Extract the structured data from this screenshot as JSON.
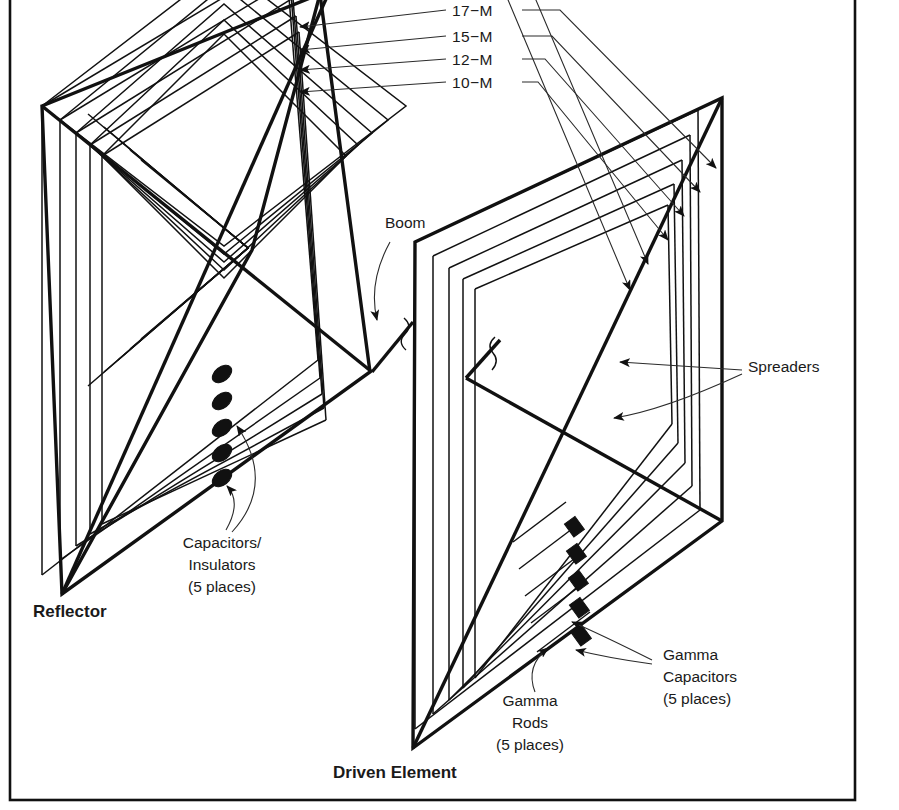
{
  "figure": {
    "kind": "line-drawing",
    "background_color": "#ffffff",
    "line_color": "#111111",
    "frame": {
      "visible": true,
      "x": 10,
      "y": 0,
      "width": 845,
      "height": 800
    }
  },
  "band_labels": [
    {
      "id": "band-20m",
      "text": "20−M",
      "visible_partially": true,
      "x": 452,
      "y": -6
    },
    {
      "id": "band-17m",
      "text": "17−M",
      "x": 452,
      "y": 14
    },
    {
      "id": "band-15m",
      "text": "15−M",
      "x": 452,
      "y": 41
    },
    {
      "id": "band-12m",
      "text": "12−M",
      "x": 452,
      "y": 64
    },
    {
      "id": "band-10m",
      "text": "10−M",
      "x": 452,
      "y": 87
    }
  ],
  "callouts": {
    "boom": {
      "label": "Boom",
      "x": 385,
      "y": 228
    },
    "spreaders": {
      "label": "Spreaders",
      "x": 748,
      "y": 372
    },
    "capacitors_insulators": {
      "line1": "Capacitors/",
      "line2": "Insulators",
      "line3": "(5 places)",
      "x": 168,
      "y": 540
    },
    "gamma_capacitors": {
      "line1": "Gamma",
      "line2": "Capacitors",
      "line3": "(5 places)",
      "x": 660,
      "y": 658
    },
    "gamma_rods": {
      "line1": "Gamma",
      "line2": "Rods",
      "line3": "(5 places)",
      "x": 527,
      "y": 708
    }
  },
  "elements": {
    "reflector": {
      "label": "Reflector",
      "x": 33,
      "y": 617
    },
    "driven": {
      "label": "Driven Element",
      "x": 333,
      "y": 775
    }
  },
  "counts": {
    "loops_per_element": 5,
    "capacitors_reflector": 5,
    "gamma_capacitors": 5,
    "gamma_rods": 5,
    "spreader_arms": 4
  }
}
